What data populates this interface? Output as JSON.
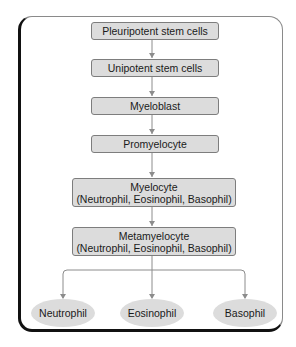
{
  "diagram": {
    "nodes": [
      {
        "id": "pluripotent",
        "label": "Pleuripotent stem cells"
      },
      {
        "id": "unipotent",
        "label": "Unipotent stem cells"
      },
      {
        "id": "myeloblast",
        "label": "Myeloblast"
      },
      {
        "id": "promyelocyte",
        "label": "Promyelocyte"
      },
      {
        "id": "myelocyte",
        "label": "Myelocyte",
        "sublabel": "(Neutrophil, Eosinophil, Basophil)"
      },
      {
        "id": "metamyelocyte",
        "label": "Metamyelocyte",
        "sublabel": "(Neutrophil, Eosinophil, Basophil)"
      }
    ],
    "outputs": [
      {
        "id": "neutrophil",
        "label": "Neutrophil"
      },
      {
        "id": "eosinophil",
        "label": "Eosinophil"
      },
      {
        "id": "basophil",
        "label": "Basophil"
      }
    ],
    "edges": [
      [
        "pluripotent",
        "unipotent"
      ],
      [
        "unipotent",
        "myeloblast"
      ],
      [
        "myeloblast",
        "promyelocyte"
      ],
      [
        "promyelocyte",
        "myelocyte"
      ],
      [
        "myelocyte",
        "metamyelocyte"
      ],
      [
        "metamyelocyte",
        "neutrophil"
      ],
      [
        "metamyelocyte",
        "eosinophil"
      ],
      [
        "metamyelocyte",
        "basophil"
      ]
    ],
    "colors": {
      "box_fill": "#dcdcdc",
      "box_border": "#7d7d7d",
      "arrow": "#8c8c8c",
      "frame": "#111111"
    }
  }
}
